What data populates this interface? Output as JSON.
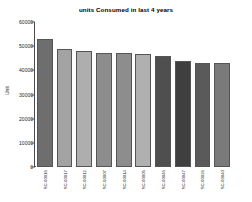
{
  "chart_data": {
    "type": "bar",
    "title": "units Consumed in last 4 years",
    "xlabel": "",
    "ylabel": "Unit",
    "ylim": [
      0,
      60000
    ],
    "yticks": [
      0,
      10000,
      20000,
      30000,
      40000,
      50000,
      60000
    ],
    "ytick_labels": [
      "0",
      "10000",
      "20000",
      "30000",
      "40000",
      "50000",
      "60000"
    ],
    "grid": false,
    "legend": "none",
    "categories": [
      "SC-00016",
      "SC-00017",
      "SC-00012",
      "SC-00007",
      "SC-00014",
      "SC-00005",
      "SC-00046",
      "SC-00047",
      "SC-00026",
      "SC-00040"
    ],
    "values": [
      53000,
      49000,
      47800,
      47200,
      47200,
      46800,
      45800,
      43800,
      43200,
      43000
    ],
    "bar_colors": [
      "#6e6e6e",
      "#a3a3a3",
      "#aeaeae",
      "#8d8d8d",
      "#8d8d8d",
      "#b0b0b0",
      "#4f4f4f",
      "#3f3f3f",
      "#5a5a5a",
      "#7a7a7a"
    ]
  }
}
